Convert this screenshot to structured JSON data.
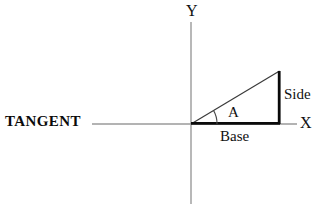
{
  "figure": {
    "title_label": "TANGENT",
    "axis_labels": {
      "x": "X",
      "y": "Y"
    },
    "annotations": {
      "angle": "A",
      "opposite_side": "Side",
      "adjacent_side": "Base"
    },
    "colors": {
      "axis": "#9a9a9a",
      "triangle_heavy": "#0a0a0a",
      "triangle_light": "#3a3a3a",
      "text": "#111111",
      "background": "#ffffff"
    },
    "geometry": {
      "origin": [
        191,
        124
      ],
      "base_end": [
        279,
        124
      ],
      "apex": [
        279,
        71
      ],
      "x_axis": [
        92,
        124,
        297,
        124
      ],
      "y_axis": [
        191,
        22,
        191,
        204
      ],
      "angle_arc_radius": 26
    }
  }
}
